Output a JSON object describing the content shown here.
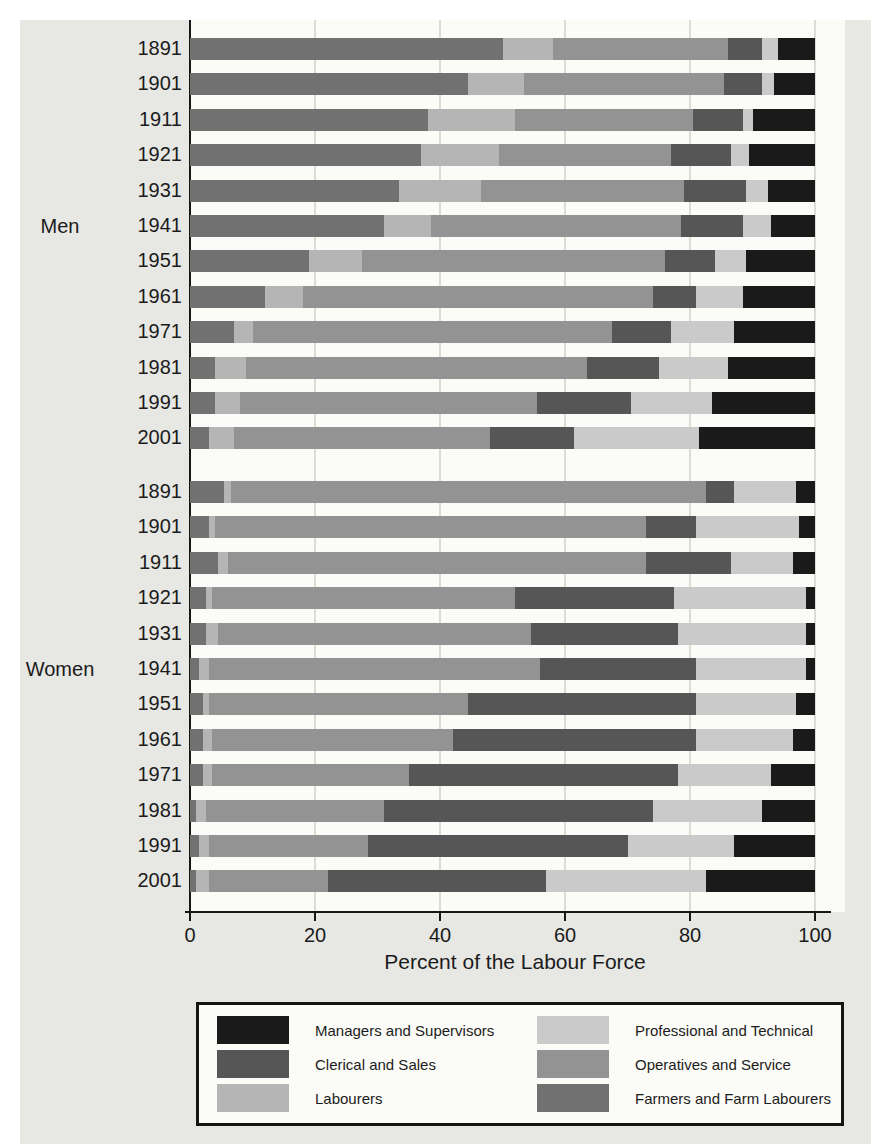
{
  "page": {
    "background": "#e7e7e3",
    "plot_background": "#fbfbf8",
    "gridline_color": "#dcdcd7",
    "axis_color": "#161616"
  },
  "chart_data": {
    "type": "bar",
    "orientation": "horizontal",
    "stacked": true,
    "title": "",
    "xlabel": "Percent of the Labour Force",
    "ylabel": "",
    "xlim": [
      0,
      100
    ],
    "x_ticks": [
      "0",
      "20",
      "40",
      "60",
      "80",
      "100"
    ],
    "grid": "vertical gridlines at ticks, on",
    "legend_position": "bottom box, two columns",
    "categories_stack_order": [
      "Farmers and Farm Labourers",
      "Labourers",
      "Operatives and Service",
      "Clerical and Sales",
      "Professional and Technical",
      "Managers and Supervisors"
    ],
    "colors": {
      "Managers and Supervisors": "#1a1a1a",
      "Clerical and Sales": "#565656",
      "Labourers": "#b5b5b5",
      "Professional and Technical": "#cacaca",
      "Operatives and Service": "#939393",
      "Farmers and Farm Labourers": "#717171"
    },
    "legend": {
      "columns": [
        {
          "items": [
            "Managers and Supervisors",
            "Clerical and Sales",
            "Labourers"
          ]
        },
        {
          "items": [
            "Professional and Technical",
            "Operatives and Service",
            "Farmers and Farm Labourers"
          ]
        }
      ]
    },
    "groups": [
      {
        "label": "Men",
        "rows": [
          {
            "year": "1891",
            "values": [
              50,
              8,
              28,
              5.5,
              2.5,
              6
            ]
          },
          {
            "year": "1901",
            "values": [
              44.5,
              9,
              32,
              6,
              2,
              6.5
            ]
          },
          {
            "year": "1911",
            "values": [
              38,
              14,
              28.5,
              8,
              1.5,
              10
            ]
          },
          {
            "year": "1921",
            "values": [
              37,
              12.5,
              27.5,
              9.5,
              3,
              10.5
            ]
          },
          {
            "year": "1931",
            "values": [
              33.5,
              13,
              32.5,
              10,
              3.5,
              7.5
            ]
          },
          {
            "year": "1941",
            "values": [
              31,
              7.5,
              40,
              10,
              4.5,
              7
            ]
          },
          {
            "year": "1951",
            "values": [
              19,
              8.5,
              48.5,
              8,
              5,
              11
            ]
          },
          {
            "year": "1961",
            "values": [
              12,
              6,
              56,
              7,
              7.5,
              11.5
            ]
          },
          {
            "year": "1971",
            "values": [
              7,
              3,
              57.5,
              9.5,
              10,
              13
            ]
          },
          {
            "year": "1981",
            "values": [
              4,
              5,
              54.5,
              11.5,
              11,
              14
            ]
          },
          {
            "year": "1991",
            "values": [
              4,
              4,
              47.5,
              15,
              13,
              16.5
            ]
          },
          {
            "year": "2001",
            "values": [
              3,
              4,
              41,
              13.5,
              20,
              18.5
            ]
          }
        ]
      },
      {
        "label": "Women",
        "rows": [
          {
            "year": "1891",
            "values": [
              5.5,
              1,
              76,
              4.5,
              10,
              3
            ]
          },
          {
            "year": "1901",
            "values": [
              3,
              1,
              69,
              8,
              16.5,
              2.5
            ]
          },
          {
            "year": "1911",
            "values": [
              4.5,
              1.5,
              67,
              13.5,
              10,
              3.5
            ]
          },
          {
            "year": "1921",
            "values": [
              2.5,
              1,
              48.5,
              25.5,
              21,
              1.5
            ]
          },
          {
            "year": "1931",
            "values": [
              2.5,
              2,
              50,
              23.5,
              20.5,
              1.5
            ]
          },
          {
            "year": "1941",
            "values": [
              1.5,
              1.5,
              53,
              25,
              17.5,
              1.5
            ]
          },
          {
            "year": "1951",
            "values": [
              2,
              1,
              41.5,
              36.5,
              16,
              3
            ]
          },
          {
            "year": "1961",
            "values": [
              2,
              1.5,
              38.5,
              39,
              15.5,
              3.5
            ]
          },
          {
            "year": "1971",
            "values": [
              2,
              1.5,
              31.5,
              43,
              15,
              7
            ]
          },
          {
            "year": "1981",
            "values": [
              1,
              1.5,
              28.5,
              43,
              17.5,
              8.5
            ]
          },
          {
            "year": "1991",
            "values": [
              1.5,
              1.5,
              25.5,
              41.5,
              17,
              13
            ]
          },
          {
            "year": "2001",
            "values": [
              1,
              2,
              19,
              35,
              25.5,
              17.5
            ]
          }
        ]
      }
    ]
  }
}
